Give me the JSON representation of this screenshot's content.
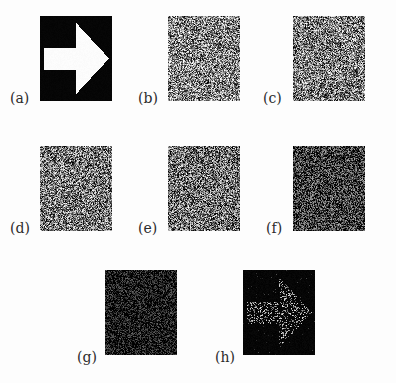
{
  "figure": {
    "background_color": "#fdfdfd",
    "label_color": "#2c2c2c",
    "panel_count": 8,
    "rows": 3,
    "columns": 3,
    "panel_width": 72,
    "panel_height": 85,
    "panels": [
      {
        "id": "a",
        "label": "(a)",
        "kind": "arrow",
        "x": 40,
        "y": 16,
        "w": 72,
        "h": 85,
        "label_x": 10,
        "label_y": 91,
        "background_color": "#050505",
        "foreground_color": "#ffffff",
        "mean_level": 1.0,
        "noise_density": 0.0,
        "description": "Original binary arrow image, white arrow on black background"
      },
      {
        "id": "b",
        "label": "(b)",
        "kind": "noise",
        "x": 168,
        "y": 16,
        "w": 72,
        "h": 85,
        "label_x": 138,
        "label_y": 91,
        "background_color": "#808080",
        "mean_level": 0.52,
        "noise_density": 1.0,
        "contrast": 0.95,
        "description": "Heavy speckle noise, mid-gray mean, arrow not visible"
      },
      {
        "id": "c",
        "label": "(c)",
        "kind": "noise",
        "x": 293,
        "y": 16,
        "w": 72,
        "h": 85,
        "label_x": 263,
        "label_y": 91,
        "background_color": "#7a7a7a",
        "mean_level": 0.49,
        "noise_density": 1.0,
        "contrast": 0.95,
        "description": "Heavy speckle noise, mid-gray mean, arrow not visible"
      },
      {
        "id": "d",
        "label": "(d)",
        "kind": "noise",
        "x": 40,
        "y": 146,
        "w": 72,
        "h": 85,
        "label_x": 10,
        "label_y": 221,
        "background_color": "#767676",
        "mean_level": 0.47,
        "noise_density": 1.0,
        "contrast": 0.95,
        "description": "Speckle noise, slightly darker mean, arrow not visible"
      },
      {
        "id": "e",
        "label": "(e)",
        "kind": "noise",
        "x": 168,
        "y": 146,
        "w": 72,
        "h": 85,
        "label_x": 138,
        "label_y": 221,
        "background_color": "#6e6e6e",
        "mean_level": 0.44,
        "noise_density": 1.0,
        "contrast": 0.95,
        "description": "Speckle noise, darker mean, arrow not visible"
      },
      {
        "id": "f",
        "label": "(f)",
        "kind": "noise",
        "x": 293,
        "y": 146,
        "w": 72,
        "h": 85,
        "label_x": 266,
        "label_y": 221,
        "background_color": "#3a3a3a",
        "mean_level": 0.24,
        "noise_density": 1.0,
        "contrast": 0.8,
        "description": "Dark speckle noise, arrow not visible"
      },
      {
        "id": "g",
        "label": "(g)",
        "kind": "noise",
        "x": 105,
        "y": 270,
        "w": 72,
        "h": 85,
        "label_x": 77,
        "label_y": 350,
        "background_color": "#141414",
        "mean_level": 0.09,
        "noise_density": 1.0,
        "contrast": 0.55,
        "description": "Very dark sparse speckle noise, arrow not visible"
      },
      {
        "id": "h",
        "label": "(h)",
        "kind": "arrow-noise",
        "x": 243,
        "y": 270,
        "w": 72,
        "h": 85,
        "label_x": 215,
        "label_y": 350,
        "background_color": "#050505",
        "mean_level": 0.06,
        "noise_density": 0.28,
        "contrast": 0.9,
        "description": "Reconstructed arrow faintly emerging as sparse bright speckles on black"
      }
    ],
    "arrow_shape": {
      "description": "right-pointing block arrow with rectangular tail and triangular head",
      "points_normalized": [
        [
          0.06,
          0.38
        ],
        [
          0.5,
          0.38
        ],
        [
          0.5,
          0.08
        ],
        [
          0.96,
          0.5
        ],
        [
          0.5,
          0.92
        ],
        [
          0.5,
          0.63
        ],
        [
          0.06,
          0.63
        ]
      ]
    }
  }
}
